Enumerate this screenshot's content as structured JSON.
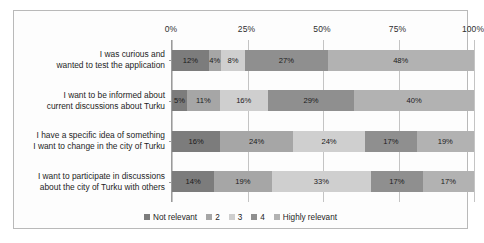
{
  "chart_data": {
    "type": "bar",
    "orientation": "horizontal",
    "stacked": true,
    "stack_mode": "percent",
    "title": "",
    "subtitle": "",
    "xlabel": "",
    "ylabel": "",
    "xlim": [
      0,
      100
    ],
    "xticks": [
      "0%",
      "25%",
      "50%",
      "75%",
      "100%"
    ],
    "xtick_values": [
      0,
      25,
      50,
      75,
      100
    ],
    "grid": true,
    "legend_position": "bottom",
    "categories": [
      "I was curious and\nwanted to test the application",
      "I want to be informed about\ncurrent discussions about Turku",
      "I have a specific idea of something\nI want to change in the city of Turku",
      "I want to participate in discussions\nabout the city of Turku with others"
    ],
    "category_lines": [
      [
        "I was curious and",
        "wanted to test the application"
      ],
      [
        "I want to be informed about",
        "current discussions about Turku"
      ],
      [
        "I have a specific idea of something",
        "I want to change in the city of Turku"
      ],
      [
        "I want to participate in discussions",
        "about the city of Turku with others"
      ]
    ],
    "series": [
      {
        "name": "Not relevant",
        "color": "#7c7c7c",
        "values": [
          12,
          5,
          16,
          14
        ]
      },
      {
        "name": "2",
        "color": "#a6a6a6",
        "values": [
          4,
          11,
          24,
          19
        ]
      },
      {
        "name": "3",
        "color": "#cfcfcf",
        "values": [
          8,
          16,
          24,
          33
        ]
      },
      {
        "name": "4",
        "color": "#8f8f8f",
        "values": [
          27,
          29,
          17,
          17
        ]
      },
      {
        "name": "Highly relevant",
        "color": "#b2b2b2",
        "values": [
          48,
          40,
          19,
          17
        ]
      }
    ],
    "data_labels": [
      [
        "12%",
        "4%",
        "8%",
        "27%",
        "48%"
      ],
      [
        "5%",
        "11%",
        "16%",
        "29%",
        "40%"
      ],
      [
        "16%",
        "24%",
        "24%",
        "17%",
        "19%"
      ],
      [
        "14%",
        "19%",
        "33%",
        "17%",
        "17%"
      ]
    ],
    "legend": [
      {
        "label": "Not relevant",
        "color": "#7c7c7c"
      },
      {
        "label": "2",
        "color": "#a6a6a6"
      },
      {
        "label": "3",
        "color": "#cfcfcf"
      },
      {
        "label": "4",
        "color": "#8f8f8f"
      },
      {
        "label": "Highly relevant",
        "color": "#b2b2b2"
      }
    ]
  },
  "colors": {
    "frame_border": "#b9b9b9",
    "axis_line": "#9a9a9a",
    "gridline": "#c4c4c4",
    "background": "#fdfdfd",
    "text": "#1d1d1d"
  }
}
